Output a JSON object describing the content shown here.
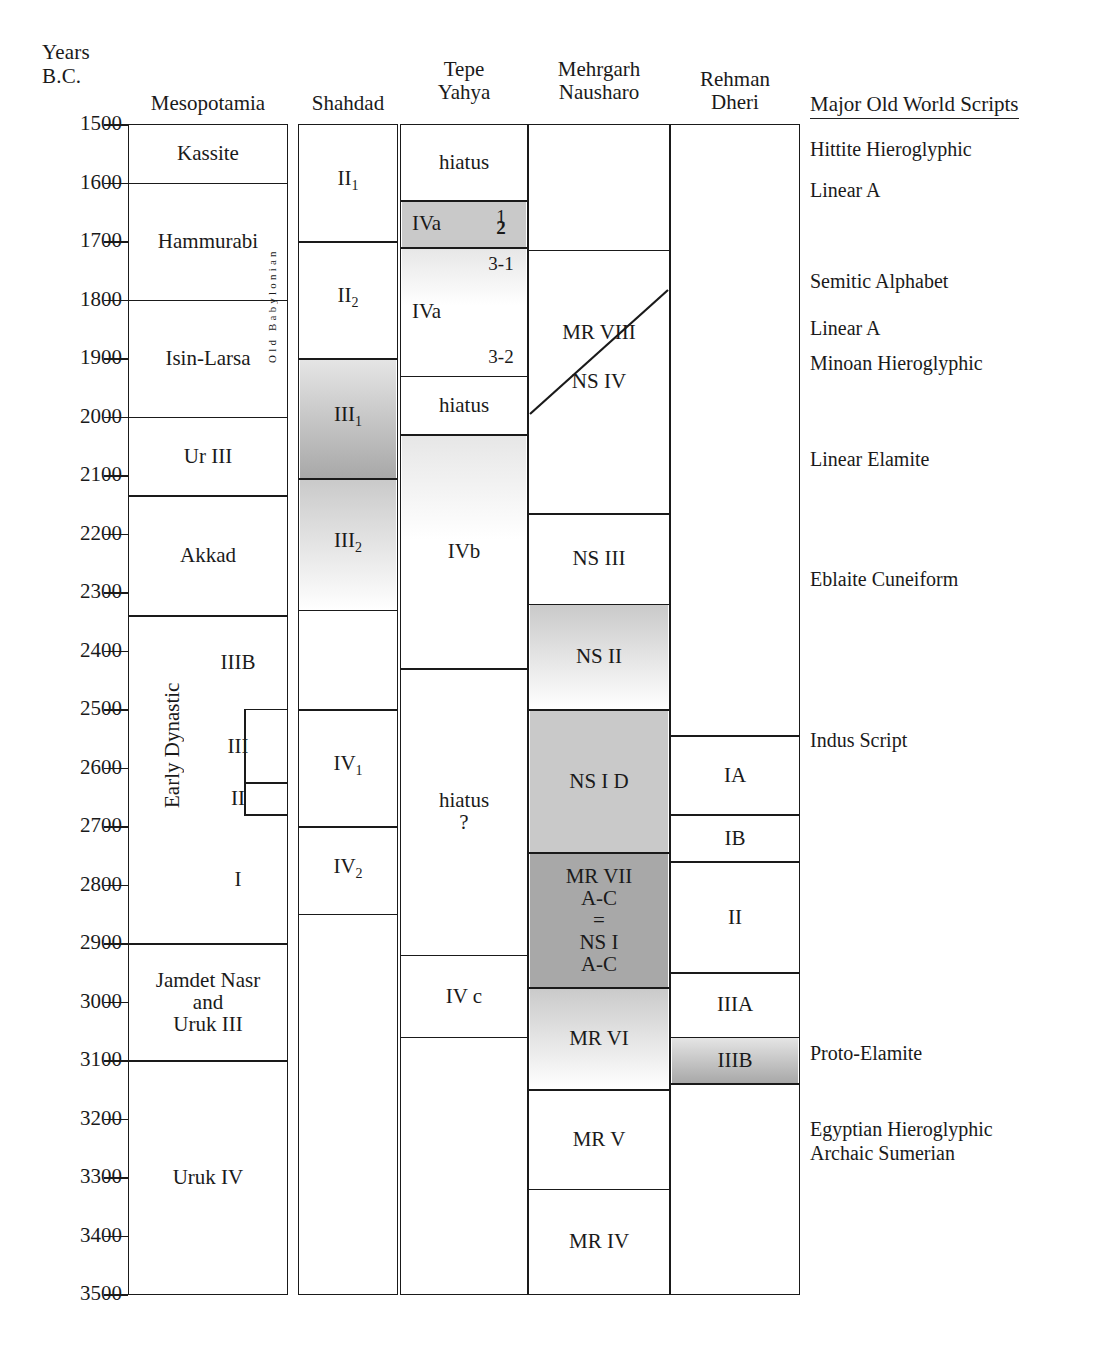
{
  "axis": {
    "title_line1": "Years",
    "title_line2": "B.C.",
    "unit": "years BC",
    "ticks": [
      1500,
      1600,
      1700,
      1800,
      1900,
      2000,
      2100,
      2200,
      2300,
      2400,
      2500,
      2600,
      2700,
      2800,
      2900,
      3000,
      3100,
      3200,
      3300,
      3400,
      3500
    ],
    "range": [
      1500,
      3500
    ],
    "direction": "older-downward"
  },
  "columns": [
    {
      "id": "mesopotamia",
      "header": "Mesopotamia",
      "header_lines": [
        "Mesopotamia"
      ]
    },
    {
      "id": "shahdad",
      "header": "Shahdad",
      "header_lines": [
        "Shahdad"
      ]
    },
    {
      "id": "tepe_yahya",
      "header": "Tepe Yahya",
      "header_lines": [
        "Tepe",
        "Yahya"
      ]
    },
    {
      "id": "mehrgarh",
      "header": "Mehrgarh Nausharo",
      "header_lines": [
        "Mehrgarh",
        "Nausharo"
      ]
    },
    {
      "id": "rehman_dheri",
      "header": "Rehman Dheri",
      "header_lines": [
        "Rehman",
        "Dheri"
      ]
    },
    {
      "id": "scripts",
      "header": "Major Old World Scripts",
      "header_lines": [
        "Major Old World Scripts"
      ]
    }
  ],
  "chart_data": {
    "type": "table",
    "xlabel": "",
    "ylabel": "Years B.C.",
    "ylim": [
      1500,
      3500
    ],
    "grid": false,
    "legend": "none",
    "series": [
      {
        "name": "Mesopotamia",
        "periods": [
          {
            "label": "Kassite",
            "from": 1500,
            "to": 1600,
            "shade": "none"
          },
          {
            "label": "Hammurabi",
            "from": 1600,
            "to": 1800,
            "shade": "none"
          },
          {
            "label": "Isin-Larsa",
            "from": 1800,
            "to": 2000,
            "shade": "none"
          },
          {
            "label": "Ur III",
            "from": 2000,
            "to": 2135,
            "shade": "none"
          },
          {
            "label": "Akkad",
            "from": 2135,
            "to": 2340,
            "shade": "none"
          },
          {
            "label": "Early Dynastic",
            "from": 2340,
            "to": 2900,
            "shade": "none",
            "orientation": "vertical",
            "subdivisions": [
              {
                "label": "IIIB",
                "from": 2340,
                "to": 2500
              },
              {
                "label": "III",
                "from": 2500,
                "to": 2625
              },
              {
                "label": "II",
                "from": 2625,
                "to": 2680
              },
              {
                "label": "I",
                "from": 2680,
                "to": 2900
              }
            ]
          },
          {
            "label": "Jamdet Nasr and Uruk III",
            "from": 2900,
            "to": 3100,
            "shade": "none",
            "label_lines": [
              "Jamdet Nasr",
              "and",
              "Uruk III"
            ]
          },
          {
            "label": "Uruk IV",
            "from": 3100,
            "to": 3500,
            "shade": "none"
          }
        ],
        "side_label": {
          "text": "Old Babylonian",
          "from": 1620,
          "to": 1990,
          "orientation": "vertical"
        }
      },
      {
        "name": "Shahdad",
        "periods": [
          {
            "label": "II 1",
            "label_main": "II",
            "label_sub": "1",
            "from": 1500,
            "to": 1700,
            "shade": "none"
          },
          {
            "label": "II 2",
            "label_main": "II",
            "label_sub": "2",
            "from": 1700,
            "to": 1900,
            "shade": "none"
          },
          {
            "label": "III 1",
            "label_main": "III",
            "label_sub": "1",
            "from": 1900,
            "to": 2105,
            "shade": "gradient-dark-down"
          },
          {
            "label": "III 2",
            "label_main": "III",
            "label_sub": "2",
            "from": 2105,
            "to": 2330,
            "shade": "gradient-light-down"
          },
          {
            "label": "",
            "from": 2330,
            "to": 2500,
            "shade": "none"
          },
          {
            "label": "IV 1",
            "label_main": "IV",
            "label_sub": "1",
            "from": 2500,
            "to": 2700,
            "shade": "none"
          },
          {
            "label": "IV 2",
            "label_main": "IV",
            "label_sub": "2",
            "from": 2700,
            "to": 2850,
            "shade": "none"
          },
          {
            "label": "",
            "from": 2850,
            "to": 3500,
            "shade": "none"
          }
        ]
      },
      {
        "name": "Tepe Yahya",
        "periods": [
          {
            "label": "hiatus",
            "from": 1500,
            "to": 1630,
            "shade": "none"
          },
          {
            "label": "IVa",
            "from": 1630,
            "to": 1710,
            "shade": "solid-mid",
            "markers": [
              {
                "text": "1",
                "bold": false
              },
              {
                "text": "2",
                "bold": true
              }
            ]
          },
          {
            "label": "IVa",
            "from": 1710,
            "to": 1930,
            "shade": "gradient-light-up",
            "markers": [
              {
                "text": "3-1",
                "bold": false
              },
              {
                "text": "3-2",
                "bold": false
              }
            ]
          },
          {
            "label": "hiatus",
            "from": 1930,
            "to": 2030,
            "shade": "none"
          },
          {
            "label": "IVb",
            "from": 2030,
            "to": 2430,
            "shade": "gradient-light-up"
          },
          {
            "label": "hiatus ?",
            "label_lines": [
              "hiatus",
              "?"
            ],
            "from": 2430,
            "to": 2920,
            "shade": "none"
          },
          {
            "label": "IV c",
            "from": 2920,
            "to": 3060,
            "shade": "none"
          },
          {
            "label": "",
            "from": 3060,
            "to": 3500,
            "shade": "none"
          }
        ]
      },
      {
        "name": "Mehrgarh Nausharo",
        "periods": [
          {
            "label": "",
            "from": 1500,
            "to": 1715,
            "shade": "none"
          },
          {
            "label": "MR VIII",
            "from": 1715,
            "to": 1995,
            "shade": "none",
            "divider": "diagonal"
          },
          {
            "label": "NS IV",
            "from": 1715,
            "to": 2165,
            "shade": "none"
          },
          {
            "label": "NS III",
            "from": 2165,
            "to": 2320,
            "shade": "none"
          },
          {
            "label": "NS II",
            "from": 2320,
            "to": 2500,
            "shade": "gradient-light-down"
          },
          {
            "label": "NS I D",
            "from": 2500,
            "to": 2745,
            "shade": "solid-mid"
          },
          {
            "label": "MR VII A-C = NS I A-C",
            "label_lines": [
              "MR VII",
              "A-C",
              "=",
              "NS I",
              "A-C"
            ],
            "from": 2745,
            "to": 2975,
            "shade": "solid-dark"
          },
          {
            "label": "MR VI",
            "from": 2975,
            "to": 3150,
            "shade": "gradient-light-down"
          },
          {
            "label": "MR V",
            "from": 3150,
            "to": 3320,
            "shade": "none"
          },
          {
            "label": "MR IV",
            "from": 3320,
            "to": 3500,
            "shade": "none"
          }
        ]
      },
      {
        "name": "Rehman Dheri",
        "periods": [
          {
            "label": "",
            "from": 1500,
            "to": 2545,
            "shade": "none"
          },
          {
            "label": "IA",
            "from": 2545,
            "to": 2680,
            "shade": "none"
          },
          {
            "label": "IB",
            "from": 2680,
            "to": 2760,
            "shade": "none"
          },
          {
            "label": "II",
            "from": 2760,
            "to": 2950,
            "shade": "none"
          },
          {
            "label": "IIIA",
            "from": 2950,
            "to": 3060,
            "shade": "none"
          },
          {
            "label": "IIIB",
            "from": 3060,
            "to": 3140,
            "shade": "gradient-dark-down"
          },
          {
            "label": "",
            "from": 3140,
            "to": 3500,
            "shade": "none"
          }
        ]
      }
    ],
    "scripts": [
      {
        "label": "Hittite Hieroglyphic",
        "at": 1545
      },
      {
        "label": "Linear A",
        "at": 1615
      },
      {
        "label": "Semitic Alphabet",
        "at": 1770
      },
      {
        "label": "Linear A",
        "at": 1850
      },
      {
        "label": "Minoan Hieroglyphic",
        "at": 1910
      },
      {
        "label": "Linear Elamite",
        "at": 2075
      },
      {
        "label": "Eblaite Cuneiform",
        "at": 2280
      },
      {
        "label": "Indus Script",
        "at": 2555
      },
      {
        "label": "Proto-Elamite",
        "at": 3090
      },
      {
        "label": "Egyptian Hieroglyphic",
        "at": 3220
      },
      {
        "label": "Archaic Sumerian",
        "at": 3260
      }
    ]
  },
  "colors": {
    "ink": "#1a1a1a",
    "shade_light": "#e6e6e6",
    "shade_mid": "#c9c9c9",
    "shade_dark": "#a8a8a8",
    "background": "#ffffff"
  }
}
